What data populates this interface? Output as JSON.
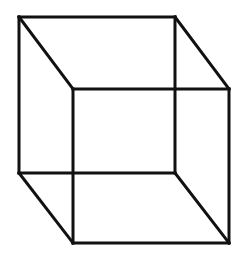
{
  "diagram": {
    "type": "necker-cube",
    "canvas": {
      "width": 246,
      "height": 266,
      "background": "#ffffff"
    },
    "stroke": {
      "color": "#111111",
      "width": 3
    },
    "vertices": {
      "back_top_left": [
        19,
        17
      ],
      "back_top_right": [
        175,
        17
      ],
      "back_bottom_left": [
        19,
        173
      ],
      "back_bottom_right": [
        175,
        173
      ],
      "front_top_left": [
        73,
        89
      ],
      "front_top_right": [
        229,
        89
      ],
      "front_bottom_left": [
        73,
        243
      ],
      "front_bottom_right": [
        229,
        243
      ]
    },
    "edges": [
      [
        "back_top_left",
        "back_top_right"
      ],
      [
        "back_top_right",
        "back_bottom_right"
      ],
      [
        "back_bottom_right",
        "back_bottom_left"
      ],
      [
        "back_bottom_left",
        "back_top_left"
      ],
      [
        "front_top_left",
        "front_top_right"
      ],
      [
        "front_top_right",
        "front_bottom_right"
      ],
      [
        "front_bottom_right",
        "front_bottom_left"
      ],
      [
        "front_bottom_left",
        "front_top_left"
      ],
      [
        "back_top_left",
        "front_top_left"
      ],
      [
        "back_top_right",
        "front_top_right"
      ],
      [
        "back_bottom_left",
        "front_bottom_left"
      ],
      [
        "back_bottom_right",
        "front_bottom_right"
      ]
    ]
  }
}
